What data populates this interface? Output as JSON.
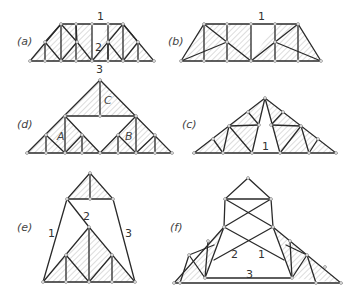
{
  "figure": {
    "panels": [
      {
        "id": "a",
        "label": "(a)",
        "member_labels": [
          "1",
          "2",
          "3"
        ],
        "shape": "trapezoid truss, central open panel"
      },
      {
        "id": "b",
        "label": "(b)",
        "member_labels": [
          "1"
        ],
        "shape": "trapezoid truss, central open panel"
      },
      {
        "id": "d",
        "label": "(d)",
        "member_labels": [
          "A",
          "B",
          "C"
        ],
        "shape": "triangular truss composed of three sub-trusses A, B, C"
      },
      {
        "id": "c",
        "label": "(c)",
        "member_labels": [
          "1"
        ],
        "shape": "triangular truss with central open triangle"
      },
      {
        "id": "e",
        "label": "(e)",
        "member_labels": [
          "1",
          "2",
          "3"
        ],
        "shape": "compound truss: top triangle and bottom truss joined by bars 1, 2, 3"
      },
      {
        "id": "f",
        "label": "(f)",
        "member_labels": [
          "2",
          "1",
          "3"
        ],
        "shape": "compound truss with crossed bars and two hatched side trusses"
      }
    ],
    "colors": {
      "line": "#2a2a2a",
      "hatch": "#9a9a9a",
      "node_fill": "#ffffff",
      "text": "#444444"
    }
  }
}
